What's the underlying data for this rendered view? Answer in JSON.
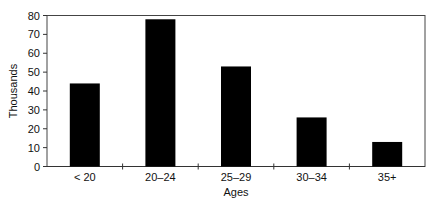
{
  "chart_data": {
    "type": "bar",
    "title": "",
    "xlabel": "Ages",
    "ylabel": "Thousands",
    "categories": [
      "< 20",
      "20–24",
      "25–29",
      "30–34",
      "35+"
    ],
    "values": [
      44,
      78,
      53,
      26,
      13
    ],
    "ylim": [
      0,
      80
    ],
    "yticks": [
      0,
      10,
      20,
      30,
      40,
      50,
      60,
      70,
      80
    ],
    "grid": false,
    "legend": null,
    "bar_color": "#000000"
  }
}
